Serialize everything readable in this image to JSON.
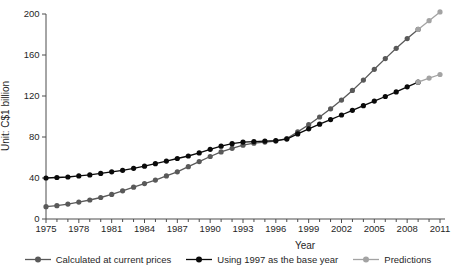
{
  "chart_data": {
    "type": "line",
    "title": "",
    "xlabel": "Year",
    "ylabel": "Unit: C$1 billion",
    "grid": false,
    "legend_position": "bottom",
    "x_axis": {
      "min": 1975,
      "max": 2011,
      "labeled_ticks": [
        1975,
        1978,
        1981,
        1984,
        1987,
        1990,
        1993,
        1996,
        1999,
        2002,
        2005,
        2008,
        2011
      ],
      "minor_tick_every": 1
    },
    "y_axis": {
      "min": 0,
      "max": 200,
      "ticks": [
        0,
        40,
        80,
        120,
        160,
        200
      ]
    },
    "legend": [
      {
        "label": "Calculated at current prices",
        "color": "#595959"
      },
      {
        "label": "Using 1997 as the base year",
        "color": "#0a0a0a"
      },
      {
        "label": "Predictions",
        "color": "#a3a3a3"
      }
    ],
    "series": [
      {
        "name": "Calculated at current prices",
        "color": "#595959",
        "x": [
          1975,
          1976,
          1977,
          1978,
          1979,
          1980,
          1981,
          1982,
          1983,
          1984,
          1985,
          1986,
          1987,
          1988,
          1989,
          1990,
          1991,
          1992,
          1993,
          1994,
          1995,
          1996,
          1997,
          1998,
          1999,
          2000,
          2001,
          2002,
          2003,
          2004,
          2005,
          2006,
          2007,
          2008,
          2009
        ],
        "values": [
          12,
          13,
          14.5,
          16.5,
          18.5,
          21,
          24,
          27.5,
          31,
          34.5,
          38,
          42,
          46,
          51,
          56,
          61,
          65.5,
          69,
          72,
          74,
          75,
          76,
          78.5,
          85,
          92,
          99.5,
          107.5,
          116,
          125.5,
          135.5,
          146,
          156.5,
          166.5,
          176,
          185
        ]
      },
      {
        "name": "Using 1997 as the base year",
        "color": "#0a0a0a",
        "x": [
          1975,
          1976,
          1977,
          1978,
          1979,
          1980,
          1981,
          1982,
          1983,
          1984,
          1985,
          1986,
          1987,
          1988,
          1989,
          1990,
          1991,
          1992,
          1993,
          1994,
          1995,
          1996,
          1997,
          1998,
          1999,
          2000,
          2001,
          2002,
          2003,
          2004,
          2005,
          2006,
          2007,
          2008,
          2009
        ],
        "values": [
          40,
          40.5,
          41,
          42,
          43,
          44.5,
          46,
          47.5,
          49.5,
          51.5,
          54,
          56.5,
          59,
          61.5,
          64.5,
          68,
          71,
          73.5,
          75,
          75.5,
          76,
          76.5,
          78,
          83,
          88,
          92.5,
          97,
          101.5,
          106,
          110.5,
          115,
          119.5,
          124,
          129,
          133.5
        ]
      },
      {
        "name": "Predictions (current prices extension)",
        "color": "#a3a3a3",
        "x": [
          2009,
          2010,
          2011
        ],
        "values": [
          185,
          193.5,
          202
        ]
      },
      {
        "name": "Predictions (1997 base year extension)",
        "color": "#a3a3a3",
        "x": [
          2009,
          2010,
          2011
        ],
        "values": [
          133.5,
          137.5,
          141
        ]
      }
    ]
  }
}
